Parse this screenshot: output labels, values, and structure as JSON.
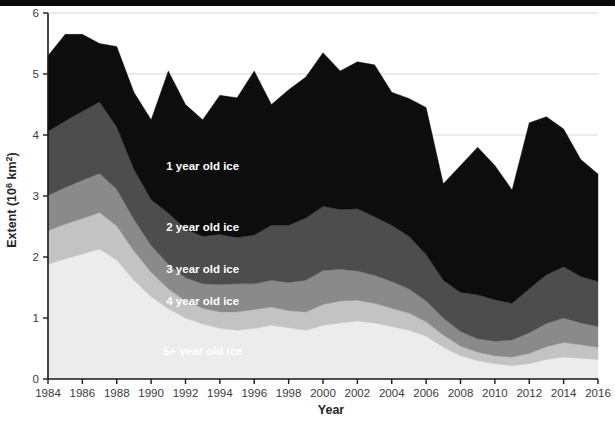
{
  "chart_data": {
    "type": "area",
    "stacked": true,
    "title": "",
    "xlabel": "Year",
    "ylabel": "Extent (10⁶ km²)",
    "ylabel_parts": {
      "prefix": "Extent (10",
      "sup": "6",
      "suffix": " km",
      "sup2": "2",
      "close": ")"
    },
    "xlim": [
      1984,
      2016
    ],
    "ylim": [
      0,
      6
    ],
    "ytick_values": [
      0,
      1,
      2,
      3,
      4,
      5,
      6
    ],
    "ytick_labels": [
      "0",
      "1",
      "2",
      "3",
      "4",
      "5",
      "6"
    ],
    "xtick_values": [
      1984,
      1986,
      1988,
      1990,
      1992,
      1994,
      1996,
      1998,
      2000,
      2002,
      2004,
      2006,
      2008,
      2010,
      2012,
      2014,
      2016
    ],
    "xtick_labels": [
      "1984",
      "1986",
      "1988",
      "1990",
      "1992",
      "1994",
      "1996",
      "1998",
      "2000",
      "2002",
      "2004",
      "2006",
      "2008",
      "2010",
      "2012",
      "2014",
      "2016"
    ],
    "grid": "horizontal",
    "legend_position": "inline-annotations",
    "x": [
      1984,
      1985,
      1986,
      1987,
      1988,
      1989,
      1990,
      1991,
      1992,
      1993,
      1994,
      1995,
      1996,
      1997,
      1998,
      1999,
      2000,
      2001,
      2002,
      2003,
      2004,
      2005,
      2006,
      2007,
      2008,
      2009,
      2010,
      2011,
      2012,
      2013,
      2014,
      2015,
      2016
    ],
    "series": [
      {
        "name": "5+ year old ice",
        "color": "#ececec",
        "label": "5+ year old ice",
        "values": [
          1.88,
          1.97,
          2.05,
          2.13,
          1.95,
          1.62,
          1.35,
          1.15,
          1.0,
          0.9,
          0.83,
          0.8,
          0.83,
          0.88,
          0.84,
          0.8,
          0.88,
          0.92,
          0.95,
          0.92,
          0.86,
          0.8,
          0.7,
          0.52,
          0.38,
          0.3,
          0.25,
          0.22,
          0.25,
          0.32,
          0.36,
          0.34,
          0.32
        ]
      },
      {
        "name": "4 year old ice",
        "color": "#c3c3c3",
        "label": "4 year old ice",
        "values": [
          0.55,
          0.57,
          0.58,
          0.6,
          0.56,
          0.48,
          0.4,
          0.33,
          0.28,
          0.26,
          0.27,
          0.3,
          0.31,
          0.3,
          0.28,
          0.3,
          0.34,
          0.36,
          0.34,
          0.32,
          0.3,
          0.28,
          0.24,
          0.2,
          0.16,
          0.14,
          0.13,
          0.14,
          0.17,
          0.21,
          0.24,
          0.22,
          0.2
        ]
      },
      {
        "name": "3 year old ice",
        "color": "#8a8a8a",
        "label": "3 year old ice",
        "values": [
          0.58,
          0.6,
          0.63,
          0.64,
          0.6,
          0.52,
          0.44,
          0.4,
          0.38,
          0.4,
          0.45,
          0.46,
          0.42,
          0.44,
          0.46,
          0.52,
          0.56,
          0.52,
          0.48,
          0.46,
          0.44,
          0.4,
          0.34,
          0.28,
          0.24,
          0.22,
          0.24,
          0.28,
          0.34,
          0.38,
          0.4,
          0.36,
          0.34
        ]
      },
      {
        "name": "2 year old ice",
        "color": "#4d4d4d",
        "label": "2 year old ice",
        "values": [
          1.05,
          1.09,
          1.13,
          1.17,
          1.02,
          0.82,
          0.75,
          0.84,
          0.8,
          0.78,
          0.82,
          0.76,
          0.8,
          0.9,
          0.94,
          1.02,
          1.05,
          0.98,
          1.02,
          0.96,
          0.92,
          0.86,
          0.76,
          0.62,
          0.64,
          0.72,
          0.68,
          0.6,
          0.72,
          0.8,
          0.84,
          0.76,
          0.74
        ]
      },
      {
        "name": "1 year old ice",
        "color": "#0d0d0d",
        "label": "1 year old ice",
        "values": [
          1.24,
          1.42,
          1.26,
          0.96,
          1.32,
          1.26,
          1.31,
          2.33,
          2.04,
          1.91,
          2.28,
          2.29,
          2.69,
          1.98,
          2.22,
          2.31,
          2.52,
          2.27,
          2.41,
          2.49,
          2.18,
          2.26,
          2.41,
          1.58,
          2.08,
          2.42,
          2.2,
          1.86,
          2.72,
          2.59,
          2.26,
          1.92,
          1.76
        ]
      }
    ],
    "totals": [
      5.3,
      5.65,
      5.65,
      5.5,
      5.45,
      4.7,
      4.25,
      5.05,
      4.5,
      4.25,
      4.65,
      4.61,
      5.05,
      4.5,
      4.74,
      4.95,
      5.35,
      5.05,
      5.2,
      5.15,
      4.7,
      4.6,
      4.45,
      3.2,
      3.5,
      3.8,
      3.5,
      3.1,
      4.2,
      4.3,
      4.1,
      3.6,
      3.36
    ]
  },
  "annotations": [
    {
      "label": "1 year old ice",
      "x": 1993.0,
      "y": 3.42
    },
    {
      "label": "2 year old ice",
      "x": 1993.0,
      "y": 2.42
    },
    {
      "label": "3 year old ice",
      "x": 1993.0,
      "y": 1.74
    },
    {
      "label": "4 year old ice",
      "x": 1993.0,
      "y": 1.22
    },
    {
      "label": "5+ year old ice",
      "x": 1993.0,
      "y": 0.4
    }
  ]
}
